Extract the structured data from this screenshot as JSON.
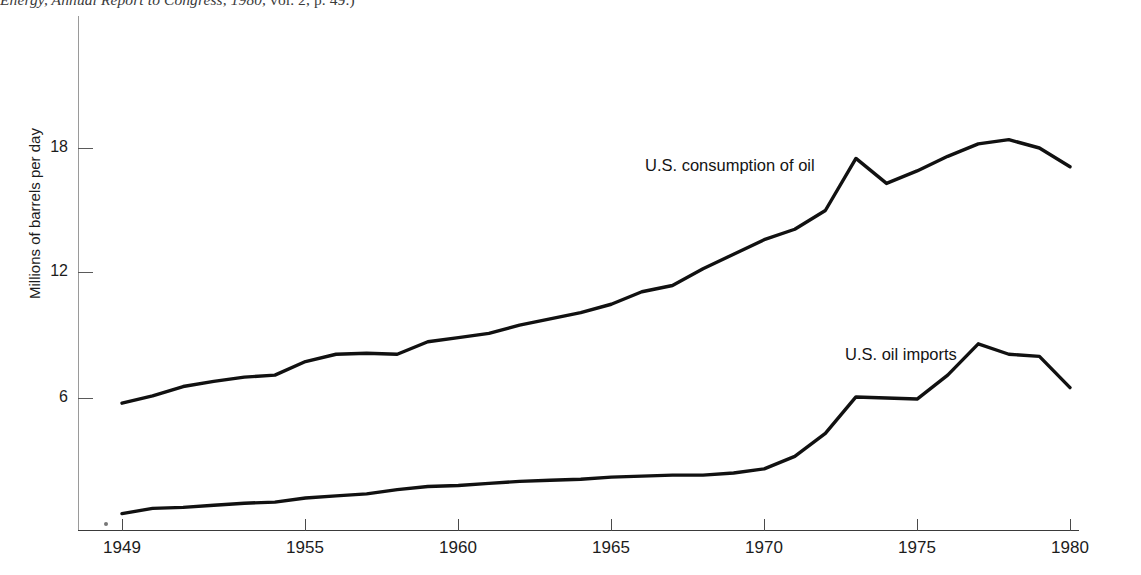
{
  "source_caption": {
    "prefix": "Energy, ",
    "italic_title": "Annual Report to Congress, 1980,",
    "suffix": " vol. 2, p. 49.)"
  },
  "chart_data": {
    "type": "line",
    "title": "",
    "xlabel": "",
    "ylabel": "Millions of barrels per day",
    "xlim": [
      1949,
      1980
    ],
    "ylim": [
      0,
      21
    ],
    "grid": false,
    "legend": "inline-labels",
    "y_ticks": [
      6,
      12,
      18
    ],
    "y_tick_labels": [
      "6",
      "12",
      "18"
    ],
    "x_ticks": [
      1949,
      1955,
      1960,
      1965,
      1970,
      1975,
      1980
    ],
    "x_tick_labels": [
      "1949",
      "1955",
      "1960",
      "1965",
      "1970",
      "1975",
      "1980"
    ],
    "x": [
      1949,
      1950,
      1951,
      1952,
      1953,
      1954,
      1955,
      1956,
      1957,
      1958,
      1959,
      1960,
      1961,
      1962,
      1963,
      1964,
      1965,
      1966,
      1967,
      1968,
      1969,
      1970,
      1971,
      1972,
      1973,
      1974,
      1975,
      1976,
      1977,
      1978,
      1979,
      1980
    ],
    "series": [
      {
        "name": "U.S. consumption of oil",
        "label": "U.S. consumption of oil",
        "label_x": 1964.4,
        "label_y": 18.6,
        "values": [
          5.75,
          6.1,
          6.55,
          6.8,
          7.0,
          7.1,
          7.75,
          8.1,
          8.15,
          8.1,
          8.7,
          8.9,
          9.1,
          9.5,
          9.8,
          10.1,
          10.5,
          11.1,
          11.4,
          12.2,
          12.9,
          13.6,
          14.1,
          15.0,
          17.5,
          16.3,
          16.9,
          17.6,
          18.2,
          18.4,
          18.0,
          17.1
        ]
      },
      {
        "name": "U.S. oil imports",
        "label": "U.S. oil imports",
        "label_x": 1973.8,
        "label_y": 9.9,
        "values": [
          0.45,
          0.7,
          0.75,
          0.85,
          0.95,
          1.0,
          1.2,
          1.3,
          1.4,
          1.6,
          1.75,
          1.8,
          1.9,
          2.0,
          2.05,
          2.1,
          2.2,
          2.25,
          2.3,
          2.3,
          2.4,
          2.6,
          3.2,
          4.3,
          6.05,
          6.0,
          5.95,
          7.1,
          8.6,
          8.1,
          8.0,
          6.5
        ]
      }
    ]
  }
}
